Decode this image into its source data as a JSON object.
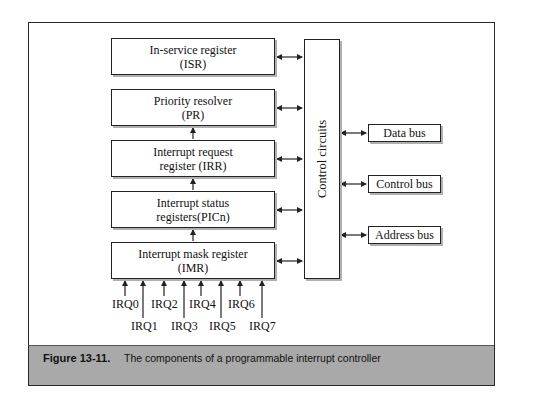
{
  "diagram": {
    "registers": [
      {
        "line1": "In-service register",
        "line2": "(ISR)"
      },
      {
        "line1": "Priority resolver",
        "line2": "(PR)"
      },
      {
        "line1": "Interrupt request",
        "line2": "register (IRR)"
      },
      {
        "line1": "Interrupt status",
        "line2": "registers(PICn)"
      },
      {
        "line1": "Interrupt mask register",
        "line2": "(IMR)"
      }
    ],
    "control": "Control circuits",
    "buses": [
      "Data bus",
      "Control bus",
      "Address bus"
    ],
    "irq_inputs": [
      "IRQ0",
      "IRQ1",
      "IRQ2",
      "IRQ3",
      "IRQ4",
      "IRQ5",
      "IRQ6",
      "IRQ7"
    ]
  },
  "caption": {
    "label": "Figure 13-11.",
    "text": "The components of a programmable interrupt controller"
  },
  "colors": {
    "caption_band": "#a9a9a9",
    "line": "#222222"
  }
}
